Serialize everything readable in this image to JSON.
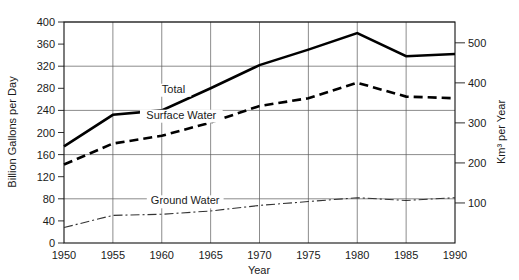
{
  "chart_data": {
    "type": "line",
    "title": "",
    "xlabel": "Year",
    "ylabel": "Billion Gallons per Day",
    "ylabel_right": "Km³ per Year",
    "x": [
      1950,
      1955,
      1960,
      1965,
      1970,
      1975,
      1980,
      1985,
      1990
    ],
    "xlim": [
      1950,
      1990
    ],
    "ylim": [
      0,
      400
    ],
    "ylim_right": [
      0,
      552
    ],
    "grid": true,
    "legend_position": "inline-labels",
    "yticks": [
      0,
      40,
      80,
      120,
      160,
      200,
      240,
      280,
      320,
      360,
      400
    ],
    "yticks_right": [
      100,
      200,
      300,
      400,
      500
    ],
    "xticks": [
      1950,
      1955,
      1960,
      1965,
      1970,
      1975,
      1980,
      1985,
      1990
    ],
    "gridlines_y": [
      80,
      160,
      240,
      320,
      400
    ],
    "series": [
      {
        "name": "Total",
        "style": "solid",
        "values": [
          175,
          232,
          240,
          280,
          322,
          350,
          380,
          338,
          342
        ]
      },
      {
        "name": "Surface Water",
        "style": "dashed",
        "values": [
          142,
          180,
          194,
          218,
          248,
          262,
          290,
          265,
          262
        ]
      },
      {
        "name": "Ground Water",
        "style": "dash-dot",
        "values": [
          28,
          50,
          52,
          58,
          68,
          75,
          82,
          77,
          82
        ]
      }
    ],
    "annotations": [
      {
        "text": "Total",
        "x": 1961.2,
        "y": 272
      },
      {
        "text": "Surface Water",
        "x": 1962.0,
        "y": 225
      },
      {
        "text": "Ground Water",
        "x": 1962.4,
        "y": 70
      }
    ],
    "colors": {
      "total": "#000000",
      "surface_water": "#000000",
      "ground_water": "#333333",
      "grid": "#5a5a5a",
      "frame": "#111111",
      "background": "#ffffff"
    }
  },
  "xtick_labels": [
    "1950",
    "1955",
    "1960",
    "1965",
    "1970",
    "1975",
    "1980",
    "1985",
    "1990"
  ],
  "ytick_labels": [
    "0",
    "40",
    "80",
    "120",
    "160",
    "200",
    "240",
    "280",
    "320",
    "360",
    "400"
  ],
  "ytick_right_labels": [
    "100",
    "200",
    "300",
    "400",
    "500"
  ],
  "axis": {
    "x_title": "Year",
    "y_title_left": "Billion Gallons per Day",
    "y_title_right": "Km³ per Year"
  },
  "series_labels": {
    "total": "Total",
    "surface_water": "Surface Water",
    "ground_water": "Ground Water"
  }
}
